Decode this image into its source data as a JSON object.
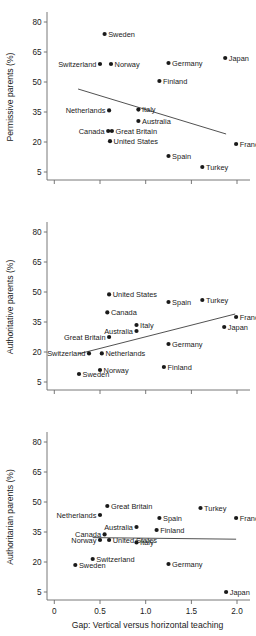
{
  "figure": {
    "width": 256,
    "height": 636,
    "background": "#ffffff",
    "dot_color": "#1a1a1a",
    "axis_color": "#6a6a6a",
    "trend_color": "#3d3d3d",
    "xlabel": "Gap: Vertical versus horizontal teaching",
    "x_ticks": [
      "0",
      "0.5",
      "1.0",
      "1.5",
      "2.0"
    ],
    "x_tick_values": [
      0,
      0.5,
      1.0,
      1.5,
      2.0
    ],
    "y_ticks": [
      "80",
      "65",
      "50",
      "35",
      "20",
      "5"
    ],
    "y_tick_values": [
      80,
      65,
      50,
      35,
      20,
      5
    ]
  },
  "chart_data": [
    {
      "type": "scatter",
      "title": "",
      "ylabel": "Permissive parents (%)",
      "xlabel": "",
      "xlim": [
        -0.08,
        2.12
      ],
      "ylim": [
        1,
        84
      ],
      "grid": false,
      "legend": "none",
      "points": [
        {
          "label": "Sweden",
          "x": 0.55,
          "y": 74.0,
          "label_side": "right"
        },
        {
          "label": "Switzerland",
          "x": 0.5,
          "y": 59.0,
          "label_side": "left"
        },
        {
          "label": "Norway",
          "x": 0.62,
          "y": 59.0,
          "label_side": "right"
        },
        {
          "label": "Japan",
          "x": 1.87,
          "y": 62.0,
          "label_side": "right"
        },
        {
          "label": "Germany",
          "x": 1.25,
          "y": 59.5,
          "label_side": "right"
        },
        {
          "label": "Finland",
          "x": 1.15,
          "y": 50.5,
          "label_side": "right"
        },
        {
          "label": "Netherlands",
          "x": 0.6,
          "y": 35.8,
          "label_side": "left"
        },
        {
          "label": "Italy",
          "x": 0.92,
          "y": 36.2,
          "label_side": "right"
        },
        {
          "label": "Australia",
          "x": 0.92,
          "y": 30.5,
          "label_side": "right"
        },
        {
          "label": "Canada",
          "x": 0.59,
          "y": 25.5,
          "label_side": "left"
        },
        {
          "label": "Great Britain",
          "x": 0.63,
          "y": 25.5,
          "label_side": "right"
        },
        {
          "label": "United States",
          "x": 0.61,
          "y": 20.4,
          "label_side": "right"
        },
        {
          "label": "France",
          "x": 1.99,
          "y": 19.0,
          "label_side": "right"
        },
        {
          "label": "Spain",
          "x": 1.25,
          "y": 13.0,
          "label_side": "right"
        },
        {
          "label": "Turkey",
          "x": 1.62,
          "y": 7.5,
          "label_side": "right"
        }
      ],
      "trend": {
        "x1": 0.26,
        "y1": 46.5,
        "x2": 1.88,
        "y2": 24.0
      }
    },
    {
      "type": "scatter",
      "title": "",
      "ylabel": "Authoritative parents (%)",
      "xlabel": "",
      "xlim": [
        -0.08,
        2.12
      ],
      "ylim": [
        1,
        84
      ],
      "grid": false,
      "legend": "none",
      "points": [
        {
          "label": "United States",
          "x": 0.6,
          "y": 48.8,
          "label_side": "right"
        },
        {
          "label": "Spain",
          "x": 1.25,
          "y": 45.0,
          "label_side": "right"
        },
        {
          "label": "Turkey",
          "x": 1.62,
          "y": 46.0,
          "label_side": "right"
        },
        {
          "label": "Canada",
          "x": 0.58,
          "y": 39.8,
          "label_side": "right"
        },
        {
          "label": "France",
          "x": 1.99,
          "y": 37.5,
          "label_side": "right"
        },
        {
          "label": "Italy",
          "x": 0.9,
          "y": 33.5,
          "label_side": "right"
        },
        {
          "label": "Japan",
          "x": 1.86,
          "y": 32.5,
          "label_side": "right"
        },
        {
          "label": "Australia",
          "x": 0.9,
          "y": 30.5,
          "label_side": "left"
        },
        {
          "label": "Great Britain",
          "x": 0.6,
          "y": 27.5,
          "label_side": "left"
        },
        {
          "label": "Germany",
          "x": 1.25,
          "y": 24.0,
          "label_side": "right"
        },
        {
          "label": "Switzerland",
          "x": 0.38,
          "y": 19.3,
          "label_side": "left"
        },
        {
          "label": "Netherlands",
          "x": 0.52,
          "y": 19.3,
          "label_side": "right"
        },
        {
          "label": "Finland",
          "x": 1.2,
          "y": 12.5,
          "label_side": "right"
        },
        {
          "label": "Norway",
          "x": 0.5,
          "y": 11.0,
          "label_side": "right"
        },
        {
          "label": "Sweden",
          "x": 0.27,
          "y": 9.0,
          "label_side": "right"
        }
      ],
      "trend": {
        "x1": 0.26,
        "y1": 19.0,
        "x2": 1.98,
        "y2": 39.0
      }
    },
    {
      "type": "scatter",
      "title": "",
      "ylabel": "Authoritarian parents (%)",
      "xlabel": "Gap: Vertical versus horizontal teaching",
      "xlim": [
        -0.08,
        2.12
      ],
      "ylim": [
        1,
        84
      ],
      "grid": false,
      "legend": "none",
      "points": [
        {
          "label": "Great Britain",
          "x": 0.58,
          "y": 48.0,
          "label_side": "right"
        },
        {
          "label": "Turkey",
          "x": 1.6,
          "y": 47.0,
          "label_side": "right"
        },
        {
          "label": "Netherlands",
          "x": 0.5,
          "y": 43.5,
          "label_side": "left"
        },
        {
          "label": "Spain",
          "x": 1.15,
          "y": 42.0,
          "label_side": "right"
        },
        {
          "label": "France",
          "x": 1.99,
          "y": 42.0,
          "label_side": "right"
        },
        {
          "label": "Australia",
          "x": 0.9,
          "y": 37.5,
          "label_side": "left"
        },
        {
          "label": "Finland",
          "x": 1.12,
          "y": 36.0,
          "label_side": "right"
        },
        {
          "label": "Canada",
          "x": 0.55,
          "y": 33.8,
          "label_side": "left"
        },
        {
          "label": "United States",
          "x": 0.6,
          "y": 31.0,
          "label_side": "right"
        },
        {
          "label": "Norway",
          "x": 0.5,
          "y": 31.0,
          "label_side": "left"
        },
        {
          "label": "Italy",
          "x": 0.9,
          "y": 29.8,
          "label_side": "right"
        },
        {
          "label": "Switzerland",
          "x": 0.42,
          "y": 21.5,
          "label_side": "right"
        },
        {
          "label": "Sweden",
          "x": 0.23,
          "y": 18.5,
          "label_side": "right"
        },
        {
          "label": "Germany",
          "x": 1.25,
          "y": 19.0,
          "label_side": "right"
        },
        {
          "label": "Japan",
          "x": 1.88,
          "y": 5.0,
          "label_side": "right"
        }
      ],
      "trend": {
        "x1": 0.42,
        "y1": 32.2,
        "x2": 1.99,
        "y2": 31.4
      }
    }
  ]
}
